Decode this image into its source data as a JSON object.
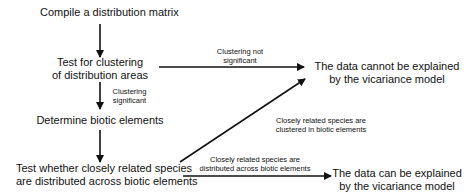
{
  "nodes": {
    "compile": "Compile a distribution matrix",
    "test_cluster_1": "Test for clustering",
    "test_cluster_2": "of distribution areas",
    "determine": "Determine biotic elements",
    "test_species_1": "Test whether closely related species",
    "test_species_2": "are distributed across biotic elements",
    "cannot_1": "The data cannot be explained",
    "cannot_2": "by the vicariance model",
    "can_1": "The data can be explained",
    "can_2": "by the vicariance model"
  },
  "edge_labels": {
    "not_sig_1": "Clustering not",
    "not_sig_2": "significant",
    "sig_1": "Clustering",
    "sig_2": "significant",
    "clustered_1": "Closely related species are",
    "clustered_2": "clustered in biotic elements",
    "distributed_1": "Closely related species are",
    "distributed_2": "distributed across biotic elements"
  }
}
